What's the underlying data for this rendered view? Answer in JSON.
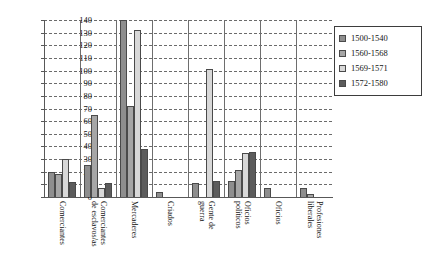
{
  "chart_data": {
    "type": "bar",
    "title": "",
    "subtitle": "",
    "xlabel": "",
    "ylabel": "",
    "ylim": [
      0,
      140
    ],
    "ytick_step": 10,
    "yticks": [
      140,
      130,
      120,
      110,
      100,
      90,
      80,
      70,
      60,
      50,
      40,
      30,
      20,
      10,
      0
    ],
    "grid": true,
    "grid_style": "dashed-horizontal",
    "category_separators": true,
    "legend_position": "top-right",
    "orientation": "vertical",
    "grouping": "clustered",
    "categories": [
      "Comerciantes",
      "Comerciantes de esclavos/as",
      "Mercaderes",
      "Criados",
      "Gente de guerra",
      "Oficios políticos",
      "Oficios",
      "Profesiones liberales"
    ],
    "category_label_lines": [
      [
        "Comerciantes"
      ],
      [
        "Comerciantes",
        "de esclavos/as"
      ],
      [
        "Mercaderes"
      ],
      [
        "Criados"
      ],
      [
        "Gente de",
        "guerra"
      ],
      [
        "Oficios",
        "políticos"
      ],
      [
        "Oficios"
      ],
      [
        "Profesiones",
        "liberales"
      ]
    ],
    "series": [
      {
        "name": "1500-1540",
        "color": "#8e8e8e",
        "values": [
          20,
          25,
          140,
          4,
          11,
          13,
          7,
          7
        ]
      },
      {
        "name": "1560-1568",
        "color": "#a6a6a6",
        "values": [
          18,
          65,
          72,
          0,
          0,
          21,
          0,
          2
        ]
      },
      {
        "name": "1569-1571",
        "color": "#d8d8d8",
        "values": [
          30,
          7,
          132,
          0,
          101,
          35,
          0,
          0
        ]
      },
      {
        "name": "1572-1580",
        "color": "#5c5c5c",
        "values": [
          12,
          11,
          38,
          0,
          13,
          36,
          0,
          0
        ]
      }
    ]
  },
  "legend": {
    "entries": [
      {
        "label": "1500-1540",
        "color": "#8e8e8e"
      },
      {
        "label": "1560-1568",
        "color": "#a6a6a6"
      },
      {
        "label": "1569-1571",
        "color": "#d8d8d8"
      },
      {
        "label": "1572-1580",
        "color": "#5c5c5c"
      }
    ]
  }
}
